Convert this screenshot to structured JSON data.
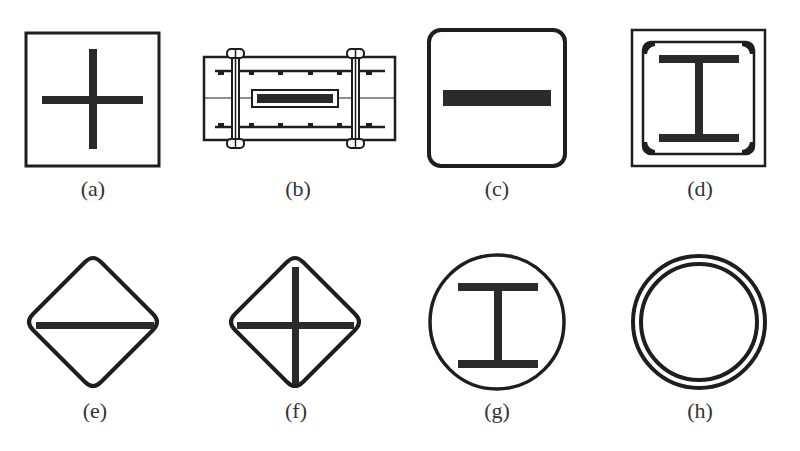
{
  "figure": {
    "panels": [
      {
        "id": "a",
        "label": "(a)",
        "shape": "square-frame-with-cross"
      },
      {
        "id": "b",
        "label": "(b)",
        "shape": "rectangular-bolted-section-with-inner-plate"
      },
      {
        "id": "c",
        "label": "(c)",
        "shape": "rounded-square-with-horizontal-bar"
      },
      {
        "id": "d",
        "label": "(d)",
        "shape": "double-square-frame-with-i-beam"
      },
      {
        "id": "e",
        "label": "(e)",
        "shape": "diamond-with-horizontal-bar"
      },
      {
        "id": "f",
        "label": "(f)",
        "shape": "diamond-with-cross"
      },
      {
        "id": "g",
        "label": "(g)",
        "shape": "circle-with-i-beam"
      },
      {
        "id": "h",
        "label": "(h)",
        "shape": "double-circle-ring"
      }
    ],
    "colors": {
      "stroke": "#1e1e1e",
      "background": "#ffffff",
      "label": "#333333"
    }
  }
}
